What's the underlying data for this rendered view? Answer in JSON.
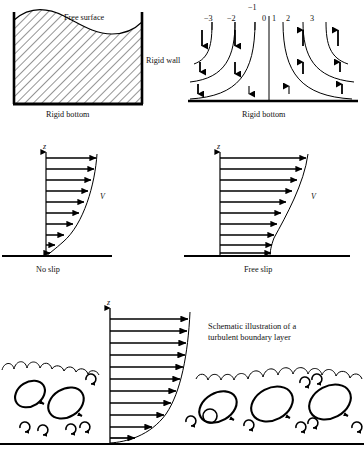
{
  "panels": {
    "container": {
      "name": "free-surface-container",
      "labels": {
        "free_surface": "Free surface",
        "rigid_wall": "Rigid wall",
        "rigid_bottom": "Rigid bottom"
      }
    },
    "stagnation": {
      "name": "stagnation-flow",
      "labels": {
        "rigid_bottom": "Rigid bottom"
      },
      "tick_labels": [
        "−3",
        "−2",
        "−1",
        "0",
        "1",
        "2",
        "3"
      ],
      "tick_x": [
        60,
        96,
        124,
        139,
        152,
        176,
        212
      ],
      "tick_y": [
        26,
        26,
        14,
        26,
        26,
        26,
        26
      ]
    },
    "no_slip": {
      "name": "no-slip-profile",
      "labels": {
        "axis_z": "z",
        "velocity": "V",
        "caption": "No slip"
      }
    },
    "free_slip": {
      "name": "free-slip-profile",
      "labels": {
        "axis_z": "z",
        "velocity": "V",
        "caption": "Free slip"
      }
    },
    "turbulent": {
      "name": "turbulent-boundary-layer",
      "labels": {
        "axis_z": "z",
        "caption_line1": "Schematic illustration of a",
        "caption_line2": "turbulent boundary layer"
      }
    }
  },
  "colors": {
    "ink": "#000000",
    "text": "#111111",
    "hatch": "#2b2b2b",
    "background": "#ffffff"
  }
}
